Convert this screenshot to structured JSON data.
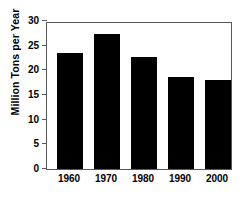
{
  "chart_data": {
    "type": "bar",
    "title": "",
    "xlabel": "",
    "ylabel": "Million Tons per Year",
    "categories": [
      "1960",
      "1970",
      "1980",
      "1990",
      "2000"
    ],
    "values": [
      23.6,
      27.3,
      22.8,
      18.7,
      18.1
    ],
    "ylim": [
      0,
      30
    ],
    "ytick_labels": [
      "0",
      "5",
      "10",
      "15",
      "20",
      "25",
      "30"
    ],
    "ytick_values": [
      0,
      5,
      10,
      15,
      20,
      25,
      30
    ],
    "grid": false,
    "legend": null,
    "bar_color": "#000000",
    "axis_color": "#585858",
    "background_color": "#ffffff"
  },
  "figure": {
    "top_crop_text": "",
    "frame_visible": true
  }
}
